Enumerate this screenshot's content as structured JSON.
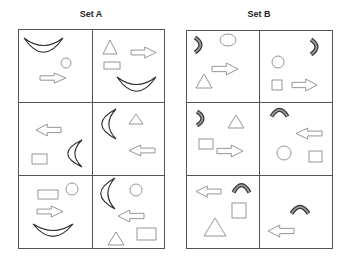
{
  "sets": [
    {
      "id": "A",
      "title": "Set A",
      "title_x": 41,
      "grid": {
        "x": 18,
        "y": 29,
        "w": 146,
        "h": 219,
        "col_split": 92,
        "row_splits": [
          102,
          175
        ]
      },
      "cells": [
        {
          "shapes": [
            {
              "type": "crescent-smile",
              "x": 24,
              "y": 38,
              "w": 39,
              "h": 15
            },
            {
              "type": "circle",
              "cx": 66,
              "cy": 63,
              "r": 5
            },
            {
              "type": "arrow-right",
              "x": 40,
              "y": 73,
              "w": 26,
              "h": 10
            }
          ]
        },
        {
          "shapes": [
            {
              "type": "triangle",
              "x": 103,
              "y": 40,
              "w": 14,
              "h": 14
            },
            {
              "type": "arrow-right",
              "x": 131,
              "y": 47,
              "w": 25,
              "h": 11
            },
            {
              "type": "rect",
              "x": 104,
              "y": 62,
              "w": 16,
              "h": 7
            },
            {
              "type": "crescent-smile",
              "x": 117,
              "y": 77,
              "w": 39,
              "h": 15
            }
          ]
        },
        {
          "shapes": [
            {
              "type": "arrow-left",
              "x": 36,
              "y": 124,
              "w": 25,
              "h": 12
            },
            {
              "type": "rect",
              "x": 32,
              "y": 154,
              "w": 15,
              "h": 10
            },
            {
              "type": "crescent-c",
              "x": 67,
              "y": 140,
              "w": 15,
              "h": 27
            }
          ]
        },
        {
          "shapes": [
            {
              "type": "crescent-c",
              "x": 101,
              "y": 109,
              "w": 15,
              "h": 30
            },
            {
              "type": "triangle",
              "x": 129,
              "y": 114,
              "w": 14,
              "h": 10
            },
            {
              "type": "arrow-left",
              "x": 129,
              "y": 145,
              "w": 26,
              "h": 11
            }
          ]
        },
        {
          "shapes": [
            {
              "type": "rect",
              "x": 38,
              "y": 190,
              "w": 20,
              "h": 9
            },
            {
              "type": "circle",
              "cx": 72,
              "cy": 189,
              "r": 6
            },
            {
              "type": "arrow-right",
              "x": 37,
              "y": 206,
              "w": 26,
              "h": 11
            },
            {
              "type": "crescent-smile",
              "x": 33,
              "y": 224,
              "w": 40,
              "h": 13
            }
          ]
        },
        {
          "shapes": [
            {
              "type": "crescent-c",
              "x": 100,
              "y": 178,
              "w": 15,
              "h": 31
            },
            {
              "type": "circle",
              "cx": 136,
              "cy": 190,
              "r": 6
            },
            {
              "type": "arrow-left",
              "x": 118,
              "y": 210,
              "w": 26,
              "h": 12
            },
            {
              "type": "triangle",
              "x": 108,
              "y": 232,
              "w": 16,
              "h": 13
            },
            {
              "type": "rect",
              "x": 137,
              "y": 228,
              "w": 19,
              "h": 12
            }
          ]
        }
      ]
    },
    {
      "id": "B",
      "title": "Set B",
      "title_x": 209,
      "grid": {
        "x": 186,
        "y": 30,
        "w": 146,
        "h": 218,
        "col_split": 259,
        "row_splits": [
          102,
          175
        ]
      },
      "cells": [
        {
          "shapes": [
            {
              "type": "arc-right",
              "x": 194,
              "y": 36,
              "w": 7,
              "h": 18
            },
            {
              "type": "ellipse",
              "cx": 228,
              "cy": 40,
              "rx": 8,
              "ry": 6
            },
            {
              "type": "arrow-right",
              "x": 212,
              "y": 63,
              "w": 26,
              "h": 12
            },
            {
              "type": "triangle",
              "x": 196,
              "y": 74,
              "w": 16,
              "h": 14
            }
          ]
        },
        {
          "shapes": [
            {
              "type": "arc-right",
              "x": 310,
              "y": 38,
              "w": 7,
              "h": 18
            },
            {
              "type": "circle",
              "cx": 278,
              "cy": 62,
              "r": 6
            },
            {
              "type": "rect",
              "x": 272,
              "y": 80,
              "w": 10,
              "h": 10
            },
            {
              "type": "arrow-right",
              "x": 292,
              "y": 79,
              "w": 25,
              "h": 12
            }
          ]
        },
        {
          "shapes": [
            {
              "type": "arc-right",
              "x": 196,
              "y": 110,
              "w": 7,
              "h": 17
            },
            {
              "type": "triangle",
              "x": 228,
              "y": 115,
              "w": 16,
              "h": 13
            },
            {
              "type": "rect",
              "x": 199,
              "y": 139,
              "w": 14,
              "h": 10
            },
            {
              "type": "arrow-right",
              "x": 217,
              "y": 145,
              "w": 26,
              "h": 12
            }
          ]
        },
        {
          "shapes": [
            {
              "type": "arc-top",
              "x": 270,
              "y": 109,
              "w": 19,
              "h": 8
            },
            {
              "type": "arrow-left",
              "x": 296,
              "y": 128,
              "w": 26,
              "h": 11
            },
            {
              "type": "circle",
              "cx": 284,
              "cy": 153,
              "r": 7
            },
            {
              "type": "rect",
              "x": 309,
              "y": 151,
              "w": 13,
              "h": 11
            }
          ]
        },
        {
          "shapes": [
            {
              "type": "arrow-left",
              "x": 196,
              "y": 186,
              "w": 25,
              "h": 11
            },
            {
              "type": "arc-top",
              "x": 232,
              "y": 184,
              "w": 19,
              "h": 9
            },
            {
              "type": "rect",
              "x": 232,
              "y": 203,
              "w": 14,
              "h": 15
            },
            {
              "type": "triangle",
              "x": 204,
              "y": 218,
              "w": 22,
              "h": 18
            }
          ]
        },
        {
          "shapes": [
            {
              "type": "arc-top",
              "x": 290,
              "y": 206,
              "w": 20,
              "h": 8
            },
            {
              "type": "arrow-left",
              "x": 268,
              "y": 225,
              "w": 26,
              "h": 12
            }
          ]
        }
      ]
    }
  ],
  "colors": {
    "grid_line": "#555555",
    "shape_stroke": "#8a8a8a",
    "crescent_stroke": "#2a2a2a",
    "arc_outline": "#333333",
    "arc_fill": "#9a9a9a"
  }
}
